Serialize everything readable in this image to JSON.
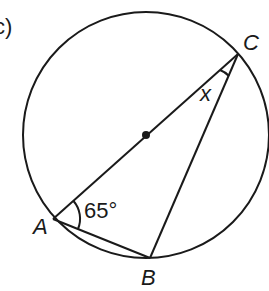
{
  "figure": {
    "part_label": "c)",
    "points": {
      "A": {
        "label": "A",
        "x": 53,
        "y": 219
      },
      "B": {
        "label": "B",
        "x": 150,
        "y": 258
      },
      "C": {
        "label": "C",
        "x": 238,
        "y": 54
      },
      "O": {
        "x": 146,
        "y": 135
      }
    },
    "circle": {
      "cx": 146,
      "cy": 135,
      "r": 123
    },
    "angle_A": "65°",
    "angle_C": "x",
    "colors": {
      "stroke": "#1a1a1a",
      "background": "#ffffff"
    }
  }
}
